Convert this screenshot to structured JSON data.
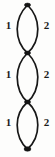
{
  "figure": {
    "width": 55,
    "height": 157,
    "background_color": "#fdfdfc",
    "stroke_color": "#171717",
    "vertex_color": "#141414",
    "label_color": "#1b1b1b"
  },
  "vertices": [
    {
      "name": "vertex-top",
      "cx": 27.5,
      "cy": 5,
      "rx": 3.0,
      "ry": 1.9
    },
    {
      "name": "vertex-upper-middle",
      "cx": 27.5,
      "cy": 53,
      "rx": 3.0,
      "ry": 1.9
    },
    {
      "name": "vertex-lower-middle",
      "cx": 27.5,
      "cy": 102,
      "rx": 3.0,
      "ry": 1.9
    },
    {
      "name": "vertex-bottom",
      "cx": 27.5,
      "cy": 149,
      "rx": 3.4,
      "ry": 2.2
    }
  ],
  "lenses": [
    {
      "name": "bigon-top",
      "top_y": 5,
      "bottom_y": 53,
      "left_path": "M 27.5 5 C 18.6 14, 17.2 22, 17.2 29 C 17.2 38, 20.6 47, 27.5 53",
      "right_path": "M 27.5 5 C 36.4 14, 37.8 22, 37.8 29 C 37.8 38, 34.4 47, 27.5 53"
    },
    {
      "name": "bigon-middle",
      "top_y": 53,
      "bottom_y": 102,
      "left_path": "M 27.5 53 C 18.6 62, 17.2 70, 17.2 77 C 17.2 87, 20.6 96, 27.5 102",
      "right_path": "M 27.5 53 C 36.4 62, 37.8 70, 37.8 77 C 37.8 87, 34.4 96, 27.5 102"
    },
    {
      "name": "bigon-bottom",
      "top_y": 102,
      "bottom_y": 149,
      "left_path": "M 27.5 102 C 18.6 110, 17.2 118, 17.2 125 C 17.2 134, 20.6 143, 27.5 149",
      "right_path": "M 27.5 102 C 36.4 110, 37.8 118, 37.8 125 C 37.8 134, 34.4 143, 27.5 149"
    }
  ],
  "labels": [
    {
      "name": "label-bigon-top-left",
      "text": "1",
      "side": "left",
      "top": 20
    },
    {
      "name": "label-bigon-top-right",
      "text": "2",
      "side": "right",
      "top": 20
    },
    {
      "name": "label-bigon-middle-left",
      "text": "1",
      "side": "left",
      "top": 69
    },
    {
      "name": "label-bigon-middle-right",
      "text": "2",
      "side": "right",
      "top": 69
    },
    {
      "name": "label-bigon-bottom-left",
      "text": "1",
      "side": "left",
      "top": 117
    },
    {
      "name": "label-bigon-bottom-right",
      "text": "2",
      "side": "right",
      "top": 117
    }
  ]
}
